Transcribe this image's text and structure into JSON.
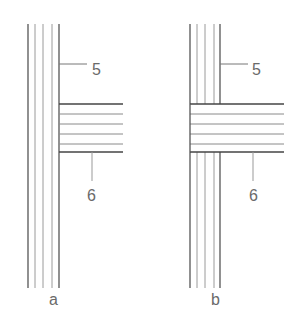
{
  "figure": {
    "line_color": "#555555",
    "thin_line_color": "#8a8a8a",
    "label_color": "#6a6a6a",
    "panels": [
      {
        "id": "a",
        "caption": "a",
        "description": "Vertical boards continuous; horizontal boards butt against the vertical members",
        "vertical_lines_x": [
          28,
          35,
          43,
          52,
          59
        ],
        "vertical_y": [
          24,
          288
        ],
        "horizontal_lines_y": [
          104,
          114,
          124,
          134,
          144,
          152
        ],
        "horizontal_x": [
          59,
          123
        ],
        "callouts": [
          {
            "label": "5",
            "target": "vertical boards"
          },
          {
            "label": "6",
            "target": "horizontal boards"
          }
        ]
      },
      {
        "id": "b",
        "caption": "b",
        "description": "Horizontal boards continuous; vertical boards interrupted by the horizontal members",
        "vertical_lines_x": [
          190,
          197,
          205,
          214,
          220
        ],
        "vertical_y": [
          24,
          288
        ],
        "horizontal_lines_y": [
          104,
          114,
          124,
          134,
          144,
          152
        ],
        "horizontal_x": [
          190,
          284
        ],
        "callouts": [
          {
            "label": "5",
            "target": "vertical boards"
          },
          {
            "label": "6",
            "target": "horizontal boards"
          }
        ]
      }
    ]
  }
}
